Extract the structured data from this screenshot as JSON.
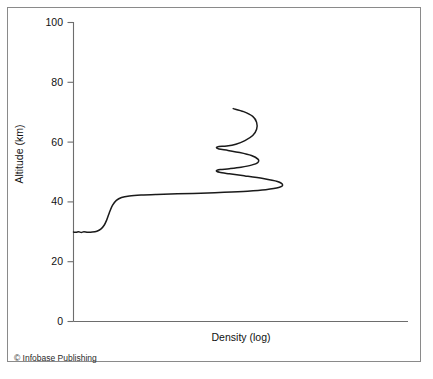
{
  "figure": {
    "copyright": "© Infobase Publishing",
    "frame_color": "#8a8a8a",
    "background_color": "#ffffff"
  },
  "chart_data": {
    "type": "line",
    "title": "",
    "subtitle": "",
    "xlabel": "Density (log)",
    "ylabel": "Altitude (km)",
    "legend": [],
    "grid": false,
    "axis_color": "#6d6d6d",
    "curve_color": "#1a1a1a",
    "xlim": [
      0,
      10
    ],
    "ylim": [
      0,
      100
    ],
    "x_ticks": [],
    "x_tick_labels": [],
    "y_ticks": [
      0,
      20,
      40,
      60,
      80,
      100
    ],
    "y_tick_labels": [
      "0",
      "20",
      "40",
      "60",
      "80",
      "100"
    ],
    "x_axis_scale": "log",
    "x_axis_unlabeled": true,
    "series": [
      {
        "name": "Density profile",
        "comment": "Vertical profile: altitude (km) on y, log density on x (arbitrary units 0-10). Traced from low-density start at top (~71 km) serpentining down to a broad plateau near 42 km, a steep drop to ~30 km, then flat to the axis.",
        "points": [
          [
            6.15,
            71.2
          ],
          [
            6.55,
            70.2
          ],
          [
            6.9,
            68.6
          ],
          [
            7.05,
            66.6
          ],
          [
            7.05,
            64.3
          ],
          [
            6.9,
            62.2
          ],
          [
            6.6,
            60.5
          ],
          [
            6.25,
            59.3
          ],
          [
            5.9,
            58.7
          ],
          [
            5.6,
            58.5
          ],
          [
            5.5,
            58.2
          ],
          [
            5.6,
            57.7
          ],
          [
            5.95,
            57.2
          ],
          [
            6.4,
            56.5
          ],
          [
            6.85,
            55.5
          ],
          [
            7.1,
            54.3
          ],
          [
            7.1,
            53.2
          ],
          [
            6.85,
            52.3
          ],
          [
            6.45,
            51.6
          ],
          [
            6.0,
            51.1
          ],
          [
            5.65,
            50.8
          ],
          [
            5.5,
            50.4
          ],
          [
            5.62,
            49.9
          ],
          [
            6.0,
            49.4
          ],
          [
            6.6,
            48.7
          ],
          [
            7.3,
            47.8
          ],
          [
            7.85,
            46.8
          ],
          [
            8.05,
            45.7
          ],
          [
            7.9,
            44.8
          ],
          [
            7.4,
            44.1
          ],
          [
            6.7,
            43.6
          ],
          [
            5.8,
            43.2
          ],
          [
            4.9,
            42.9
          ],
          [
            4.0,
            42.7
          ],
          [
            3.2,
            42.5
          ],
          [
            2.6,
            42.3
          ],
          [
            2.15,
            42.0
          ],
          [
            1.85,
            41.5
          ],
          [
            1.65,
            40.5
          ],
          [
            1.5,
            38.8
          ],
          [
            1.38,
            36.4
          ],
          [
            1.28,
            34.0
          ],
          [
            1.18,
            32.2
          ],
          [
            1.05,
            30.9
          ],
          [
            0.9,
            30.2
          ],
          [
            0.72,
            29.9
          ],
          [
            0.55,
            29.85
          ],
          [
            0.4,
            30.0
          ],
          [
            0.3,
            29.8
          ],
          [
            0.2,
            30.0
          ],
          [
            0.1,
            29.85
          ],
          [
            0.0,
            29.9
          ]
        ]
      }
    ],
    "annotations": [
      {
        "label": "stratopause plateau",
        "altitude_km": 42.5
      },
      {
        "label": "lower flat region",
        "altitude_km": 30.0
      },
      {
        "label": "curve start (top)",
        "altitude_km": 71.2
      }
    ]
  }
}
